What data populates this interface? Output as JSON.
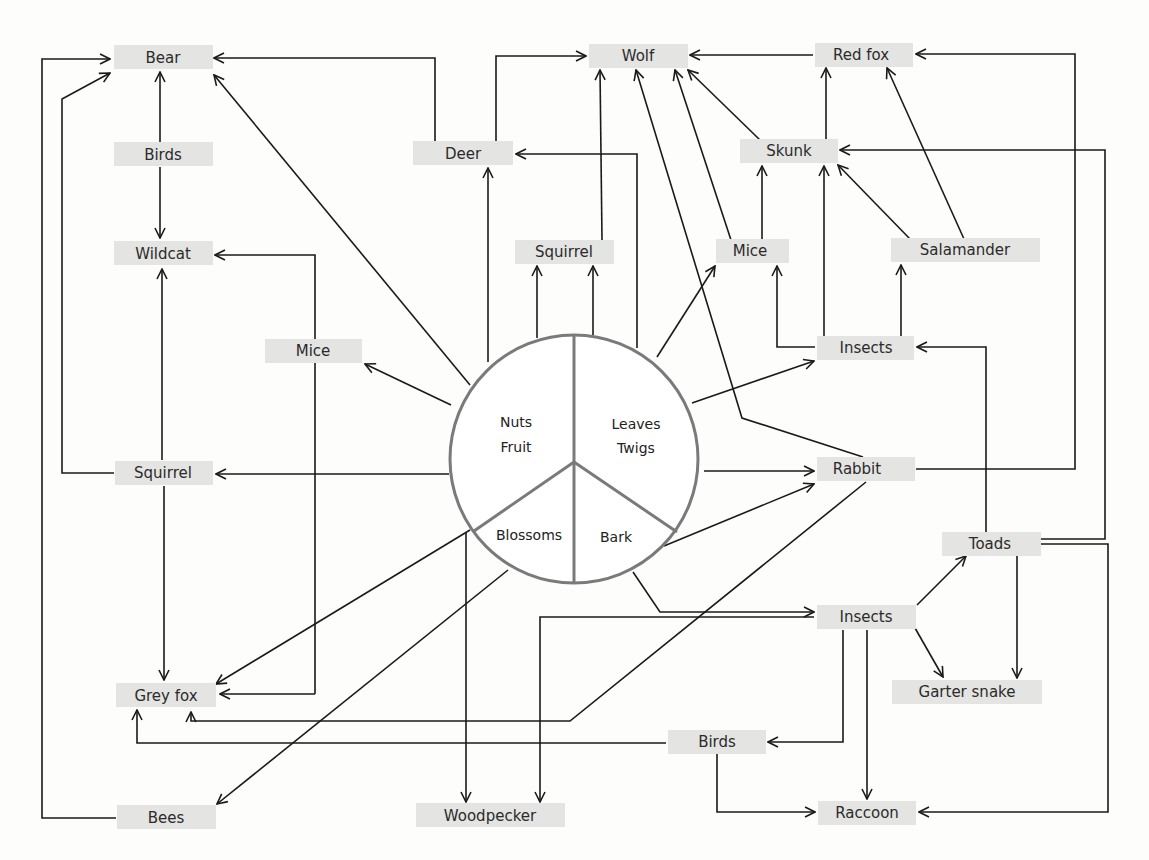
{
  "diagram": {
    "type": "food-web",
    "center": {
      "segments": [
        {
          "id": "nuts_fruit",
          "line1": "Nuts",
          "line2": "Fruit"
        },
        {
          "id": "leaves_twigs",
          "line1": "Leaves",
          "line2": "Twigs"
        },
        {
          "id": "blossoms",
          "line1": "Blossoms"
        },
        {
          "id": "bark",
          "line1": "Bark"
        }
      ]
    },
    "nodes": {
      "bear": "Bear",
      "birds_top": "Birds",
      "wildcat": "Wildcat",
      "mice_left": "Mice",
      "squirrel_left": "Squirrel",
      "grey_fox": "Grey fox",
      "bees": "Bees",
      "deer": "Deer",
      "wolf": "Wolf",
      "squirrel_top": "Squirrel",
      "mice_top": "Mice",
      "skunk": "Skunk",
      "red_fox": "Red fox",
      "salamander": "Salamander",
      "insects_mid": "Insects",
      "rabbit": "Rabbit",
      "toads": "Toads",
      "insects_bottom": "Insects",
      "garter_snake": "Garter snake",
      "birds_bottom": "Birds",
      "woodpecker": "Woodpecker",
      "raccoon": "Raccoon"
    },
    "edges": [
      [
        "birds_top",
        "bear"
      ],
      [
        "birds_top",
        "wildcat"
      ],
      [
        "squirrel_left",
        "wildcat"
      ],
      [
        "squirrel_left",
        "bear"
      ],
      [
        "squirrel_left",
        "grey_fox"
      ],
      [
        "bees",
        "bear"
      ],
      [
        "mice_left",
        "wildcat"
      ],
      [
        "mice_left",
        "grey_fox"
      ],
      [
        "nuts_fruit",
        "bear"
      ],
      [
        "nuts_fruit",
        "mice_left"
      ],
      [
        "nuts_fruit",
        "squirrel_left"
      ],
      [
        "nuts_fruit",
        "deer"
      ],
      [
        "nuts_fruit",
        "squirrel_top"
      ],
      [
        "nuts_fruit",
        "grey_fox"
      ],
      [
        "blossoms",
        "bees"
      ],
      [
        "blossoms",
        "woodpecker"
      ],
      [
        "deer",
        "bear"
      ],
      [
        "deer",
        "wolf"
      ],
      [
        "leaves_twigs",
        "deer"
      ],
      [
        "leaves_twigs",
        "squirrel_top"
      ],
      [
        "leaves_twigs",
        "mice_top"
      ],
      [
        "leaves_twigs",
        "insects_mid"
      ],
      [
        "leaves_twigs",
        "rabbit"
      ],
      [
        "squirrel_top",
        "wolf"
      ],
      [
        "mice_top",
        "wolf"
      ],
      [
        "mice_top",
        "skunk"
      ],
      [
        "skunk",
        "wolf"
      ],
      [
        "skunk",
        "red_fox"
      ],
      [
        "red_fox",
        "wolf"
      ],
      [
        "rabbit",
        "wolf"
      ],
      [
        "rabbit",
        "red_fox"
      ],
      [
        "rabbit",
        "grey_fox"
      ],
      [
        "insects_mid",
        "mice_top"
      ],
      [
        "insects_mid",
        "skunk"
      ],
      [
        "insects_mid",
        "salamander"
      ],
      [
        "salamander",
        "skunk"
      ],
      [
        "salamander",
        "red_fox"
      ],
      [
        "bark",
        "rabbit"
      ],
      [
        "bark",
        "insects_bottom"
      ],
      [
        "insects_bottom",
        "toads"
      ],
      [
        "insects_bottom",
        "garter_snake"
      ],
      [
        "insects_bottom",
        "raccoon"
      ],
      [
        "insects_bottom",
        "birds_bottom"
      ],
      [
        "insects_bottom",
        "woodpecker"
      ],
      [
        "insects_bottom",
        "grey_fox"
      ],
      [
        "toads",
        "insects_mid"
      ],
      [
        "toads",
        "skunk"
      ],
      [
        "toads",
        "garter_snake"
      ],
      [
        "toads",
        "raccoon"
      ],
      [
        "birds_bottom",
        "raccoon"
      ],
      [
        "birds_bottom",
        "grey_fox"
      ]
    ]
  }
}
